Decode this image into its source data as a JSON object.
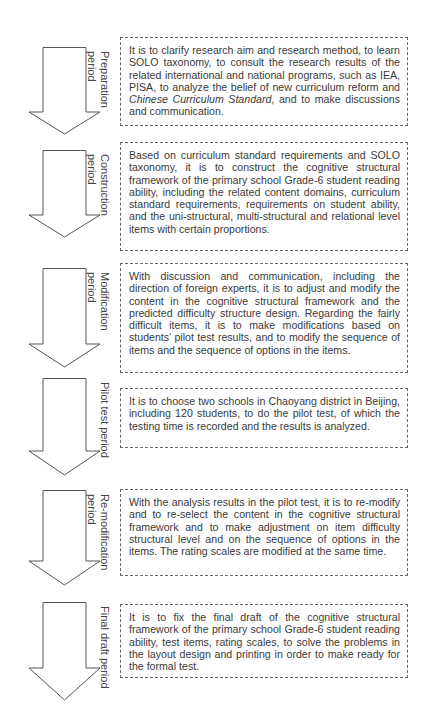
{
  "steps": [
    {
      "label": "Preparation\nperiod",
      "text_parts": [
        {
          "t": "It is to clarify research aim and research method, to learn SOLO taxonomy, to consult the research results of the related international and national programs, such as IEA, PISA, to analyze the belief of new curriculum reform and "
        },
        {
          "t": "Chinese Curriculum Standard",
          "italic": true
        },
        {
          "t": ", and to make discussions and communication."
        }
      ]
    },
    {
      "label": "Construction\nperiod",
      "text_parts": [
        {
          "t": "Based on curriculum standard requirements and SOLO taxonomy, it is to construct the cognitive structural framework of the primary school Grade-6 student reading ability, including the related content domains, curriculum standard requirements, requirements on student ability, and the uni-structural, multi-structural and relational level items with certain proportions."
        }
      ]
    },
    {
      "label": "Modification\nperiod",
      "text_parts": [
        {
          "t": "With discussion and communication, including the direction of foreign experts, it is to adjust and modify the content in the cognitive structural framework and the predicted difficulty structure design. Regarding the fairly difficult items, it is to make modifications based on students’ pilot test results, and to modify the sequence of items and the sequence of options in the items."
        }
      ]
    },
    {
      "label": "Pilot test period",
      "text_parts": [
        {
          "t": "It is to choose two schools in Chaoyang district in Beijing, including 120 students, to do the pilot test, of which the testing time is recorded and the results is analyzed."
        }
      ]
    },
    {
      "label": "Re-modification\nperiod",
      "text_parts": [
        {
          "t": "With the analysis results in the pilot test, it is to re-modify and to re-select the content in the cognitive structural framework and to make adjustment on item difficulty structural level and on the sequence of options in the items. The rating scales are modified at the same time."
        }
      ]
    },
    {
      "label": "Final draft period",
      "text_parts": [
        {
          "t": "It is to fix the final draft of the cognitive structural framework of the primary school Grade-6 student reading ability, test items, rating scales, to solve the problems in the layout design and printing in order to make ready for the formal test."
        }
      ]
    }
  ],
  "layout": {
    "arrows": [
      {
        "top": 47,
        "shaft": 65,
        "head": 22
      },
      {
        "top": 150,
        "shaft": 65,
        "head": 22
      },
      {
        "top": 268,
        "shaft": 76,
        "head": 23
      },
      {
        "top": 378,
        "shaft": 73,
        "head": 24
      },
      {
        "top": 490,
        "shaft": 71,
        "head": 24
      },
      {
        "top": 602,
        "shaft": 66,
        "head": 32
      }
    ],
    "boxes": [
      {
        "top": 37,
        "height": 89
      },
      {
        "top": 142,
        "height": 109
      },
      {
        "top": 263,
        "height": 110
      },
      {
        "top": 388,
        "height": 60
      },
      {
        "top": 489,
        "height": 87
      },
      {
        "top": 604,
        "height": 74
      }
    ],
    "colors": {
      "stroke": "#555555",
      "fill": "#ffffff",
      "text": "#3a3a3a"
    }
  }
}
